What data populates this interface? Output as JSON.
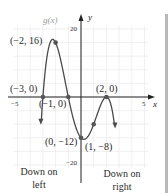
{
  "chart_data": {
    "type": "line",
    "title": "",
    "function_label": "g(x)",
    "xlabel": "x",
    "ylabel": "y",
    "xlim": [
      -5.5,
      5.5
    ],
    "ylim": [
      -22,
      24
    ],
    "grid": true,
    "tick_labels": {
      "x": [
        {
          "value": -5,
          "label": "−5"
        },
        {
          "value": 5,
          "label": "5"
        }
      ],
      "y": [
        {
          "value": 20,
          "label": "20"
        },
        {
          "value": -20,
          "label": "−20"
        }
      ]
    },
    "points": [
      {
        "x": -2,
        "y": 16,
        "label": "(−2, 16)"
      },
      {
        "x": -3,
        "y": 0,
        "label": "(−3, 0)"
      },
      {
        "x": -1,
        "y": 0,
        "label": "(−1, 0)"
      },
      {
        "x": 2,
        "y": 0,
        "label": "(2, 0)"
      },
      {
        "x": 0,
        "y": -12,
        "label": "(0, −12)"
      },
      {
        "x": 1,
        "y": -8,
        "label": "(1, −8)"
      }
    ],
    "series": [
      {
        "name": "g(x)",
        "expression": "-(x+3)(x+1)(x-2)^2"
      }
    ],
    "annotations": [
      {
        "text": "Down on left",
        "line1": "Down on",
        "line2": "left"
      },
      {
        "text": "Down on right",
        "line1": "Down on",
        "line2": "right"
      }
    ]
  },
  "labels": {
    "fname": "g(x)",
    "xaxis": "x",
    "yaxis": "y",
    "x_neg5": "−5",
    "x_pos5": "5",
    "y_pos20": "20",
    "y_neg20": "−20",
    "p_m2_16": "(−2, 16)",
    "p_m3_0": "(−3, 0)",
    "p_m1_0": "(−1, 0)",
    "p_2_0": "(2, 0)",
    "p_0_m12": "(0, −12)",
    "p_1_m8": "(1, −8)",
    "left_l1": "Down on",
    "left_l2": "left",
    "right_l1": "Down on",
    "right_l2": "right"
  },
  "colors": {
    "curve": "#4a4a4a",
    "point": "#555555",
    "grid": "#e4e4e4",
    "axis": "#222222"
  }
}
